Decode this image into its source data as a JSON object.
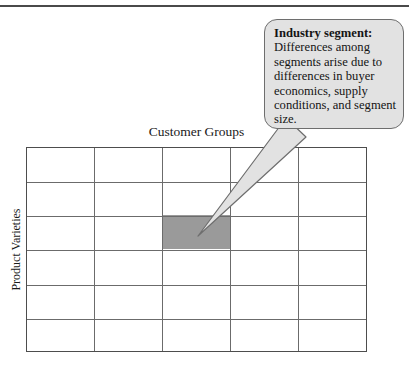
{
  "figure": {
    "type": "segmentation-matrix-diagram",
    "top_rule_color": "#4a4a4a"
  },
  "axes": {
    "x_label": "Customer Groups",
    "y_label": "Product Varieties"
  },
  "matrix": {
    "columns": 5,
    "rows": 6,
    "grid_line_color": "#6b6b6b",
    "outline_color": "#4d4d4d",
    "highlighted_cell": {
      "column_index": 3,
      "row_index": 3,
      "fill_color": "#9a9a9a",
      "label": "Industry segment"
    }
  },
  "callout": {
    "title": "Industry segment:",
    "body": "Differences among segments arise due to differences in buyer economics, supply conditions, and segment size.",
    "fill_color": "#e2e2e2",
    "border_color": "#6e6e6e",
    "points_to": "highlighted-cell"
  }
}
